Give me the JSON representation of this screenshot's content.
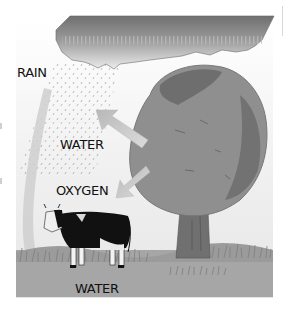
{
  "diagram": {
    "title": "",
    "labels": {
      "rain": "RAIN",
      "water_up": "WATER",
      "oxygen": "OXYGEN",
      "water_ground": "WATER"
    },
    "elements": [
      "cloud",
      "rain",
      "tree",
      "cow",
      "grass",
      "arrows"
    ],
    "colors": {
      "background": "#ffffff",
      "panel": "#ededed",
      "ground": "#a3a3a3",
      "cloud_top": "#7a7a7a",
      "cloud_bottom": "#e6e6e6",
      "tree_crown": "#8e8e8e",
      "tree_crown_dark": "#6a6a6a",
      "trunk": "#6e6e6e",
      "arrow": "#c8c8c8",
      "text": "#111111"
    }
  }
}
